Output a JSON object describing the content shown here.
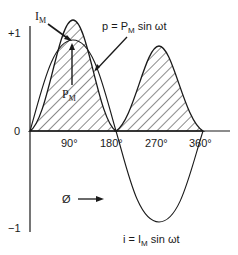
{
  "diagram": {
    "y_ticks": [
      {
        "label": "+1",
        "value": 1
      },
      {
        "label": "0",
        "value": 0
      },
      {
        "label": "−1",
        "value": -1
      }
    ],
    "x_ticks": [
      "90°",
      "180°",
      "270°",
      "360°"
    ],
    "axis_label": "Ø",
    "labels": {
      "im": "I",
      "im_sub": "M",
      "pm": "P",
      "pm_sub": "M",
      "power_eq_pre": "p = P",
      "power_eq_sub": "M",
      "power_eq_post": " sin ωt",
      "current_eq_pre": "i = I",
      "current_eq_sub": "M",
      "current_eq_post": " sin ωt"
    },
    "curves": {
      "current": "i = IM sin ωt (sine, amplitude 1)",
      "power": "p = PM sin ωt (instantaneous power, hatched, always positive, period 180°)"
    },
    "colors": {
      "stroke": "#1a1a1a",
      "background": "#ffffff"
    }
  }
}
